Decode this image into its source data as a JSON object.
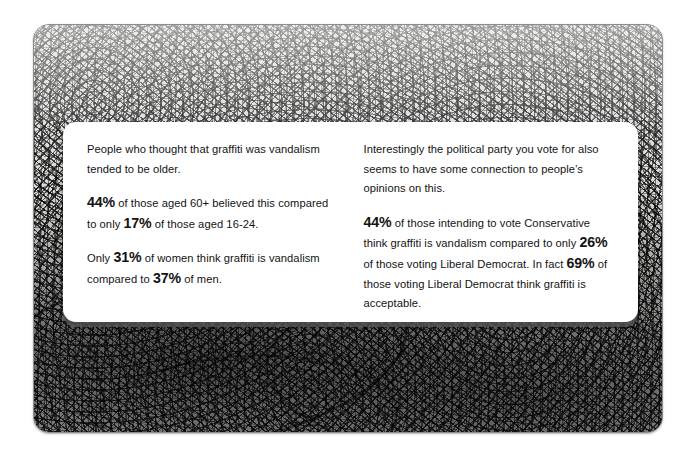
{
  "poster": {
    "background_color": "#ffffff",
    "image": {
      "name": "graffiti-wall-photograph",
      "description": "Black and white photograph of a wall densely covered in graffiti scribbles",
      "border_color": "#8d8d8d",
      "base_color": "#d8d8d6"
    },
    "card": {
      "background_color": "#ffffff",
      "shadow_color": "#5a5a5a",
      "text_color": "#131313",
      "columns": [
        {
          "id": "left-column",
          "paragraphs": [
            {
              "id": "age-intro",
              "runs": [
                {
                  "text": "People who thought that graffiti was vandalism tended to be older.",
                  "bold": false
                }
              ]
            },
            {
              "id": "age-stats",
              "runs": [
                {
                  "text": "44%",
                  "bold": true
                },
                {
                  "text": " of those aged 60+ believed this compared to  only ",
                  "bold": false
                },
                {
                  "text": "17%",
                  "bold": true
                },
                {
                  "text": " of those aged 16-24.",
                  "bold": false
                }
              ]
            },
            {
              "id": "gender-stats",
              "runs": [
                {
                  "text": "Only ",
                  "bold": false
                },
                {
                  "text": "31%",
                  "bold": true
                },
                {
                  "text": " of women think graffiti is vandalism compared to ",
                  "bold": false
                },
                {
                  "text": "37%",
                  "bold": true
                },
                {
                  "text": " of men.",
                  "bold": false
                }
              ]
            }
          ]
        },
        {
          "id": "right-column",
          "paragraphs": [
            {
              "id": "politics-intro",
              "runs": [
                {
                  "text": "Interestingly the political party you vote for also seems to have some connection to people’s opinions on this.",
                  "bold": false
                }
              ]
            },
            {
              "id": "politics-stats",
              "runs": [
                {
                  "text": "44%",
                  "bold": true
                },
                {
                  "text": " of those intending to vote Conservative think graffiti is vandalism compared to only ",
                  "bold": false
                },
                {
                  "text": "26%",
                  "bold": true
                },
                {
                  "text": " of those voting Liberal Democrat.  In fact ",
                  "bold": false
                },
                {
                  "text": "69%",
                  "bold": true
                },
                {
                  "text": " of those voting Liberal Democrat think graffiti is acceptable.",
                  "bold": false
                }
              ]
            }
          ]
        }
      ]
    }
  }
}
